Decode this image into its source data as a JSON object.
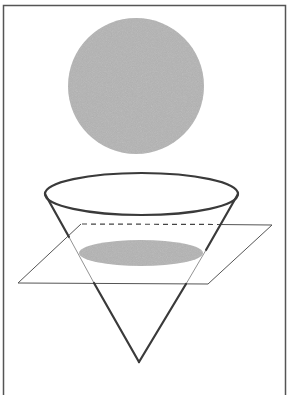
{
  "figure": {
    "colors": {
      "frame": "#555555",
      "outline": "#3a3a3a",
      "shaded_fill": "#b4b4b4",
      "background": "#ffffff"
    },
    "elements": [
      {
        "name": "circle-result",
        "shape": "circle",
        "shaded": true
      },
      {
        "name": "cone",
        "shape": "inverted-cone",
        "shaded": false
      },
      {
        "name": "cutting-plane",
        "shape": "parallelogram",
        "orientation": "horizontal"
      },
      {
        "name": "cross-section",
        "shape": "ellipse (circle in perspective)",
        "shaded": true
      }
    ]
  }
}
